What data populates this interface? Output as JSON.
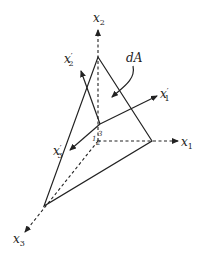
{
  "diagram": {
    "type": "tetrahedron-coordinate-transformation",
    "colors": {
      "stroke": "#222222",
      "background": "#ffffff"
    },
    "axes": {
      "x1": {
        "label": "x",
        "subscript": "1"
      },
      "x2": {
        "label": "x",
        "subscript": "2"
      },
      "x3": {
        "label": "x",
        "subscript": "3"
      }
    },
    "rotated_axes": {
      "x1p": {
        "label": "x",
        "subscript": "1",
        "prime": "′"
      },
      "x2p": {
        "label": "x",
        "subscript": "2",
        "prime": "′"
      },
      "x3p": {
        "label": "x",
        "subscript": "3",
        "prime": "′"
      }
    },
    "area_label": "dA",
    "origin_marks": {
      "a": "1",
      "b": "2",
      "c": "3"
    }
  }
}
